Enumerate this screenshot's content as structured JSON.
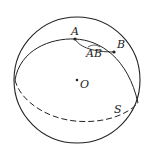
{
  "diagram": {
    "labels": {
      "point_a": "A",
      "point_b": "B",
      "arc_ab": "AB",
      "center": "O",
      "surface": "S"
    },
    "colors": {
      "stroke": "#222222",
      "background": "#ffffff"
    }
  }
}
